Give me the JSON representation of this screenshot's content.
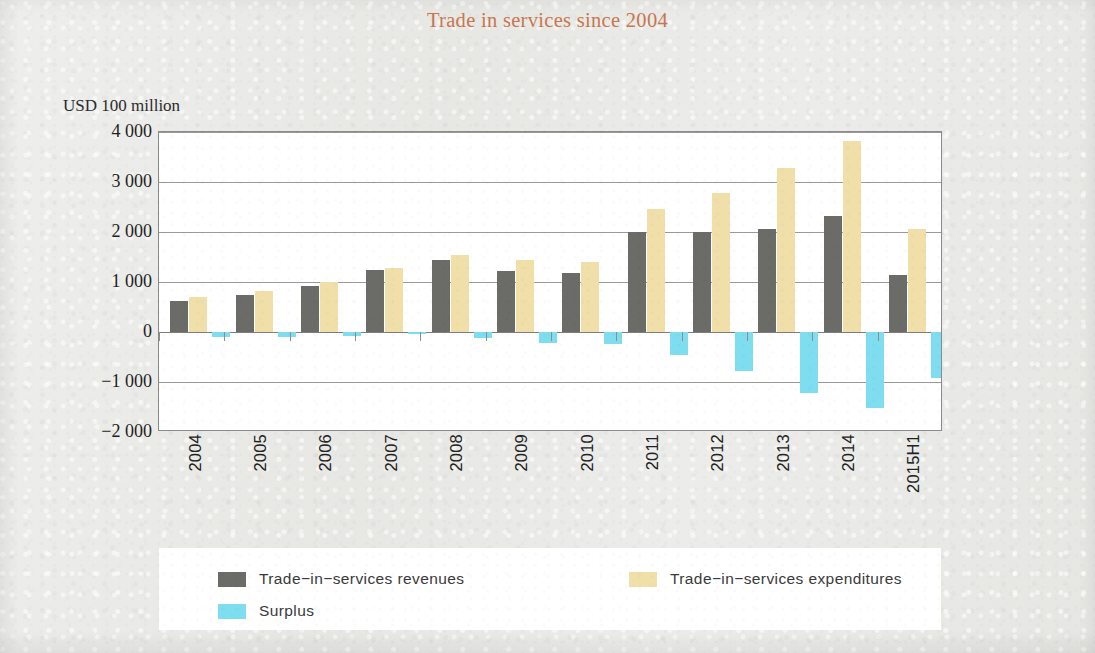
{
  "chart_data": {
    "type": "bar",
    "title": "Trade in services since 2004",
    "xlabel": "",
    "ylabel": "USD 100 million",
    "ylim": [
      -2000,
      4000
    ],
    "grid": true,
    "legend_position": "bottom",
    "ytick_labels": [
      "4 000",
      "3 000",
      "2 000",
      "1 000",
      "0",
      "−1 000",
      "−2 000"
    ],
    "ytick_values": [
      4000,
      3000,
      2000,
      1000,
      0,
      -1000,
      -2000
    ],
    "categories": [
      "2004",
      "2005",
      "2006",
      "2007",
      "2008",
      "2009",
      "2010",
      "2011",
      "2012",
      "2013",
      "2014",
      "2015H1"
    ],
    "series": [
      {
        "name": "Trade−in−services revenues",
        "color": "#6b6b68",
        "values": [
          620,
          740,
          920,
          1250,
          1440,
          1230,
          1180,
          2000,
          2010,
          2070,
          2320,
          1140
        ]
      },
      {
        "name": "Trade−in−services expenditures",
        "color": "#f0dfa8",
        "values": [
          710,
          830,
          1000,
          1290,
          1550,
          1440,
          1410,
          2460,
          2790,
          3290,
          3830,
          2060
        ]
      },
      {
        "name": "Surplus",
        "color": "#7fddf0",
        "values": [
          -90,
          -90,
          -80,
          -40,
          -110,
          -210,
          -230,
          -460,
          -780,
          -1220,
          -1510,
          -920
        ]
      }
    ]
  },
  "legend": {
    "items": [
      {
        "label": "Trade−in−services revenues",
        "swatch": "rev"
      },
      {
        "label": "Trade−in−services expenditures",
        "swatch": "exp"
      },
      {
        "label": "Surplus",
        "swatch": "sur"
      }
    ]
  },
  "colors": {
    "title": "#c8764f",
    "revenues": "#6b6b68",
    "expenditures": "#f0dfa8",
    "surplus": "#7fddf0",
    "page_background": "#e9e9e6",
    "plot_background": "#ffffff"
  }
}
